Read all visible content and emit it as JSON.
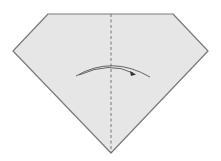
{
  "diagram": {
    "type": "origami-fold-step",
    "shape": "pentagon-diamond",
    "colors": {
      "paper_fill": "#e6e6e6",
      "paper_edge": "#7a7a7a",
      "fold_line": "#6a6a6a",
      "arrow": "#555555",
      "background": "#ffffff"
    },
    "elements": [
      {
        "id": "paper",
        "kind": "polygon",
        "points": [
          [
            48,
            14
          ],
          [
            173,
            14
          ],
          [
            208,
            51
          ],
          [
            111,
            153
          ],
          [
            13,
            51
          ]
        ]
      },
      {
        "id": "valley-fold-line",
        "kind": "dashed-line",
        "from": [
          111,
          14
        ],
        "to": [
          111,
          153
        ]
      },
      {
        "id": "fold-arrow",
        "kind": "curved-arrow",
        "direction": "left-to-right",
        "from": [
          76,
          76
        ],
        "to": [
          150,
          77
        ]
      }
    ]
  }
}
